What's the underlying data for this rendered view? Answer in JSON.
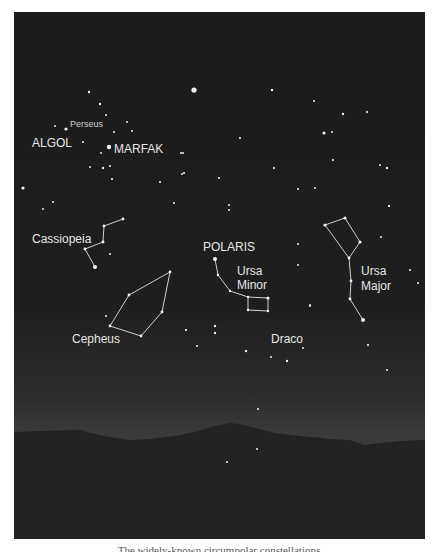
{
  "image": {
    "description": "Night sky star chart over mountain silhouette showing northern circumpolar constellations",
    "colors": {
      "sky": "#1c1c1c",
      "horizon_glow": "#3b3b3b",
      "mountains": "#262626",
      "stars": "#f0f0f0",
      "lines": "#d8d8d8",
      "labels": "#e6e6e6"
    }
  },
  "labels": {
    "perseus": "Perseus",
    "algol": "ALGOL",
    "marfak": "MARFAK",
    "cassiopeia": "Cassiopeia",
    "polaris": "POLARIS",
    "ursa_minor_1": "Ursa",
    "ursa_minor_2": "Minor",
    "ursa_major_1": "Ursa",
    "ursa_major_2": "Major",
    "cepheus": "Cepheus",
    "draco": "Draco"
  },
  "caption": "The widely-known circumpolar constellations"
}
